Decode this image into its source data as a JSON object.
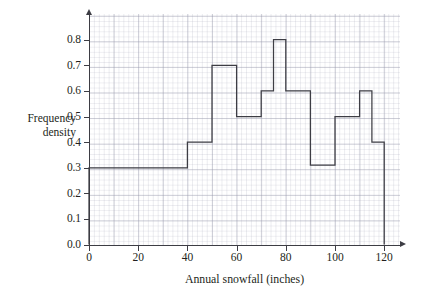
{
  "chart_data": {
    "type": "bar",
    "title": "",
    "subtitle": "",
    "xlabel": "Annual snowfall (inches)",
    "ylabel": "Frequency density",
    "ylabel_lines": [
      "Frequency",
      "density"
    ],
    "xlim": [
      0,
      120
    ],
    "ylim": [
      0.0,
      0.8
    ],
    "grid": true,
    "legend": null,
    "x_tick_labels": [
      "0",
      "20",
      "40",
      "60",
      "80",
      "100",
      "120"
    ],
    "x_tick_values": [
      0,
      20,
      40,
      60,
      80,
      100,
      120
    ],
    "y_tick_labels": [
      "0.0",
      "0.1",
      "0.2",
      "0.3",
      "0.4",
      "0.5",
      "0.6",
      "0.7",
      "0.8"
    ],
    "y_tick_values": [
      0.0,
      0.1,
      0.2,
      0.3,
      0.4,
      0.5,
      0.6,
      0.7,
      0.8
    ],
    "bin_edges": [
      0,
      40,
      50,
      60,
      70,
      75,
      80,
      85,
      90,
      100,
      110,
      115,
      120
    ],
    "categories": [
      "0-40",
      "40-50",
      "50-60",
      "60-70",
      "70-75",
      "75-80",
      "80-85",
      "85-90",
      "90-100",
      "100-110",
      "110-115",
      "115-120"
    ],
    "values": [
      0.3,
      0.4,
      0.7,
      0.5,
      0.6,
      0.8,
      0.6,
      0.6,
      0.31,
      0.5,
      0.6,
      0.4
    ],
    "bars": [
      {
        "start": 0,
        "end": 40,
        "density": 0.3
      },
      {
        "start": 40,
        "end": 50,
        "density": 0.4
      },
      {
        "start": 50,
        "end": 60,
        "density": 0.7
      },
      {
        "start": 60,
        "end": 70,
        "density": 0.5
      },
      {
        "start": 70,
        "end": 75,
        "density": 0.6
      },
      {
        "start": 75,
        "end": 80,
        "density": 0.8
      },
      {
        "start": 80,
        "end": 85,
        "density": 0.6
      },
      {
        "start": 85,
        "end": 90,
        "density": 0.6
      },
      {
        "start": 90,
        "end": 100,
        "density": 0.31
      },
      {
        "start": 100,
        "end": 110,
        "density": 0.5
      },
      {
        "start": 110,
        "end": 115,
        "density": 0.6
      },
      {
        "start": 115,
        "end": 120,
        "density": 0.4
      }
    ],
    "colors": {
      "bar_outline": "#3d3d44",
      "axis": "#3d3d44",
      "grid_major": "#9698aa",
      "grid_minor": "#aaacbc",
      "text": "#231f20",
      "background": "#ffffff"
    }
  }
}
